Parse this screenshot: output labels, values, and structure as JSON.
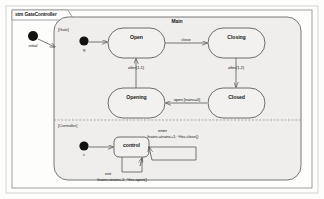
{
  "frame": {
    "title": "stm GateController",
    "keyword": "stm",
    "name": "GateController"
  },
  "composite_state": {
    "name": "Main"
  },
  "regions": [
    {
      "id": "gate",
      "tag": "[Gate]"
    },
    {
      "id": "controller",
      "tag": "[Controller]"
    }
  ],
  "pseudostates": [
    {
      "id": "initial-outer",
      "label": "initial",
      "kind": "initial"
    },
    {
      "id": "initial-gate",
      "label": "g",
      "kind": "initial"
    },
    {
      "id": "initial-controller",
      "label": "c",
      "kind": "initial"
    }
  ],
  "states": [
    {
      "id": "open",
      "name": "Open"
    },
    {
      "id": "closing",
      "name": "Closing"
    },
    {
      "id": "opening",
      "name": "Opening"
    },
    {
      "id": "closed",
      "name": "Closed"
    },
    {
      "id": "control",
      "name": "control"
    }
  ],
  "transitions": [
    {
      "id": "t-open-closing",
      "from": "open",
      "to": "closing",
      "label": "close"
    },
    {
      "id": "t-closing-closed",
      "from": "closing",
      "to": "closed",
      "label": "after(1,2)"
    },
    {
      "id": "t-closed-opening",
      "from": "closed",
      "to": "opening",
      "label": "open [trains=0]"
    },
    {
      "id": "t-opening-open",
      "from": "opening",
      "to": "open",
      "label": "after(1,1)"
    },
    {
      "id": "t-initial-gate",
      "from": "initial-gate",
      "to": "open",
      "label": ""
    },
    {
      "id": "t-initial-ctrl",
      "from": "initial-controller",
      "to": "control",
      "label": ""
    },
    {
      "id": "t-initial-outer",
      "from": "initial-outer",
      "to": "Main",
      "label": ""
    }
  ],
  "behaviors": {
    "enter": {
      "trigger": "enter",
      "effect": "/trains:=trains+1; ^this.close()"
    },
    "exit": {
      "trigger": "exit",
      "effect": "/trains:=trains-1; ^this.open()"
    }
  },
  "colors": {
    "page_background": "#ffffff",
    "canvas_background": "#fdfdfc",
    "state_fill": "#f2f1ef",
    "composite_fill": "#efeeec",
    "stroke": "#555555",
    "text": "#1a1a1a",
    "node_fill": "#111111"
  }
}
